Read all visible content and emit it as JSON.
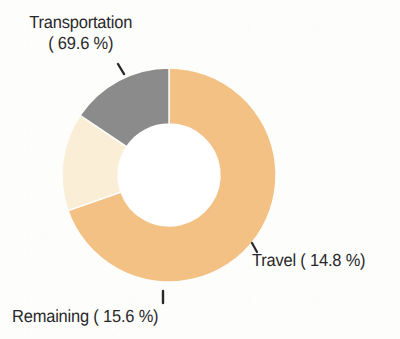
{
  "chart_data": {
    "type": "pie",
    "variant": "donut",
    "title": "",
    "subtitle": "",
    "xlabel": "",
    "ylabel": "",
    "units": "%",
    "total": 100,
    "start_angle_deg": 0,
    "direction": "clockwise",
    "inner_radius_ratio": 0.48,
    "legend_position": "none",
    "grid": false,
    "labels_outside": true,
    "categories": [
      "Transportation",
      "Travel",
      "Remaining"
    ],
    "values": [
      69.6,
      14.8,
      15.6
    ],
    "colors": [
      "#f3c184",
      "#faefd6",
      "#8b8b8b"
    ],
    "slices": [
      {
        "name": "Transportation",
        "value": 69.6,
        "value_text": "69.6",
        "color": "#f3c184",
        "label_line1": "Transportation",
        "label_line2": "( 69.6 %)",
        "label_full": "Transportation ( 69.6 %)",
        "start_deg": 0,
        "end_deg": 250.6
      },
      {
        "name": "Travel",
        "value": 14.8,
        "value_text": "14.8",
        "color": "#faefd6",
        "label_line1": "Travel ( 14.8 %)",
        "label_full": "Travel ( 14.8 %)",
        "start_deg": 250.6,
        "end_deg": 303.8
      },
      {
        "name": "Remaining",
        "value": 15.6,
        "value_text": "15.6",
        "color": "#8b8b8b",
        "label_line1": "Remaining ( 15.6 %)",
        "label_full": "Remaining ( 15.6 %)",
        "start_deg": 303.8,
        "end_deg": 360
      }
    ]
  },
  "figure": {
    "background_color": "#fdfdfc",
    "text_color": "#28282a",
    "hole_color": "#ffffff",
    "center_x": 169,
    "center_y": 175,
    "outer_radius": 107,
    "inner_radius": 51
  },
  "labels": {
    "transportation": {
      "line1": "Transportation",
      "line2": "( 69.6 %)"
    },
    "travel": {
      "line1": "Travel ( 14.8 %)"
    },
    "remaining": {
      "line1": "Remaining ( 15.6 %)"
    }
  }
}
